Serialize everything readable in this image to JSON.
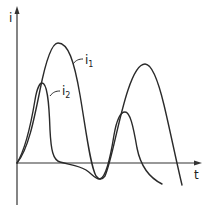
{
  "diagram": {
    "type": "current-vs-time waveform sketch",
    "axes": {
      "y_label": "i",
      "x_label": "t"
    },
    "curves": [
      {
        "id": "i1",
        "label": "i",
        "subscript": "1",
        "description": "larger-amplitude current with two peaks"
      },
      {
        "id": "i2",
        "label": "i",
        "subscript": "2",
        "description": "sharper narrower current pulse followed by a smaller second peak"
      }
    ],
    "colors": {
      "line": "#2a2a2a",
      "background": "#ffffff"
    }
  }
}
